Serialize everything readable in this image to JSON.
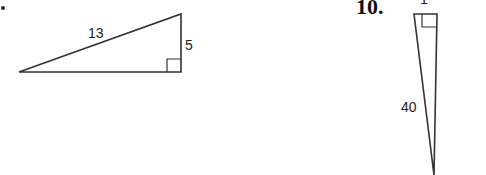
{
  "problems": [
    {
      "number": "",
      "marker": "•",
      "triangle": {
        "hypotenuse_label": "13",
        "leg_label": "5",
        "right_angle": "bottom-right"
      }
    },
    {
      "number": "10.",
      "triangle": {
        "top_leg_label": "1",
        "hypotenuse_label": "40",
        "right_angle": "top-right"
      }
    }
  ],
  "colors": {
    "stroke": "#333333",
    "background": "#ffffff"
  }
}
